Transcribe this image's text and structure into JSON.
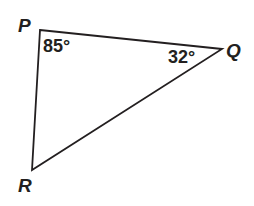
{
  "diagram": {
    "type": "triangle",
    "stroke_color": "#231f20",
    "vertices": {
      "P": {
        "label": "P",
        "x": 40,
        "y": 30
      },
      "Q": {
        "label": "Q",
        "x": 222,
        "y": 49
      },
      "R": {
        "label": "R",
        "x": 32,
        "y": 170
      }
    },
    "angles": {
      "P": {
        "label": "85°",
        "value": 85
      },
      "Q": {
        "label": "32°",
        "value": 32
      }
    }
  }
}
